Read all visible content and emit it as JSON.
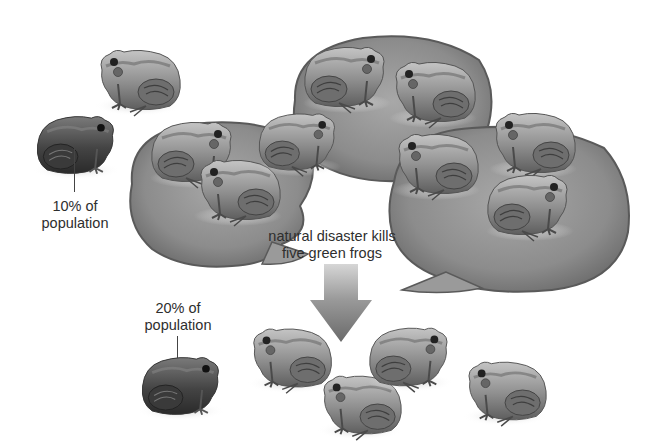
{
  "diagram": {
    "topic": "genetic drift bottleneck in a frog population",
    "before_population": {
      "total_frogs": 10,
      "brown_frogs": 1,
      "green_frogs": 9,
      "lily_pads": 3,
      "callout": {
        "line1": "10% of",
        "line2": "population"
      }
    },
    "event": {
      "line1": "natural disaster kills",
      "line2": "five green frogs"
    },
    "after_population": {
      "total_frogs": 5,
      "brown_frogs": 1,
      "green_frogs": 4,
      "callout": {
        "line1": "20% of",
        "line2": "population"
      }
    },
    "colors": {
      "background": "#ffffff",
      "text": "#2e2e2e",
      "lily_pad": "#8a8a8a",
      "lily_pad_edge": "#5a5a5a",
      "frog_light": "#a9a9a9",
      "frog_dark": "#4a4a4a",
      "arrow_top": "#c8c8c8",
      "arrow_bottom": "#6e6e6e"
    }
  }
}
